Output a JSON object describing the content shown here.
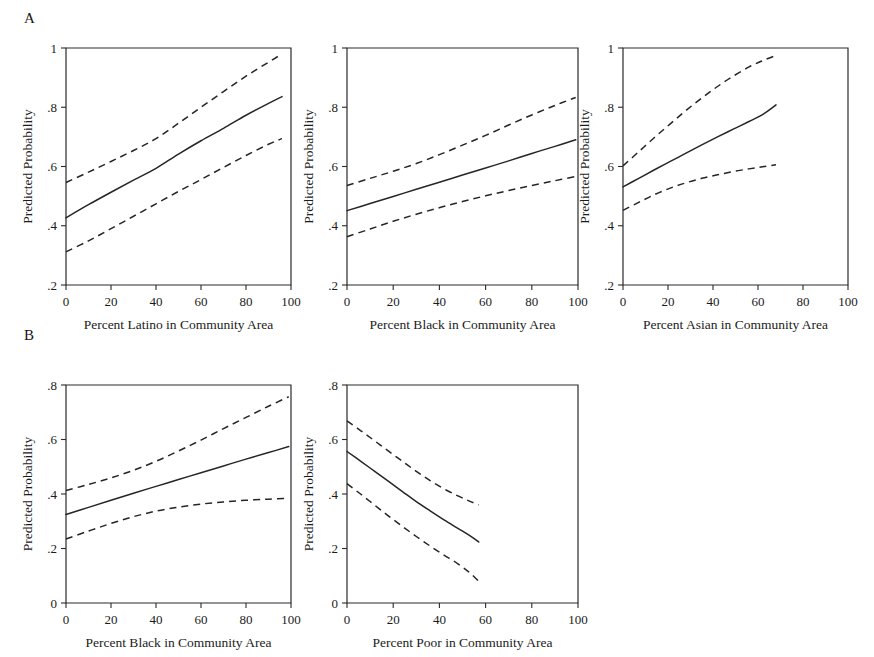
{
  "figure": {
    "background": "#ffffff",
    "line_color": "#252525",
    "panel_labels": [
      {
        "label": "A",
        "x": 24,
        "y": 10
      },
      {
        "label": "B",
        "x": 24,
        "y": 327
      }
    ]
  },
  "chart_data": [
    {
      "id": "a1",
      "panel_group": "A",
      "type": "line",
      "title": "",
      "xlabel": "Percent Latino in Community Area",
      "ylabel": "Predicted Probability",
      "xlim": [
        0,
        100
      ],
      "ylim": [
        0.2,
        1.0
      ],
      "xticks": [
        0,
        20,
        40,
        60,
        80,
        100
      ],
      "xticklabels": [
        "0",
        "20",
        "40",
        "60",
        "80",
        "100"
      ],
      "yticks": [
        0.2,
        0.4,
        0.6,
        0.8,
        1.0
      ],
      "yticklabels": [
        ".2",
        ".4",
        ".6",
        ".8",
        "1"
      ],
      "grid": false,
      "legend": "none",
      "x": [
        0,
        10,
        20,
        30,
        40,
        50,
        60,
        70,
        80,
        90,
        96
      ],
      "series": [
        {
          "name": "Predicted probability",
          "style": "solid",
          "values": [
            0.427,
            0.471,
            0.513,
            0.554,
            0.594,
            0.642,
            0.687,
            0.729,
            0.773,
            0.813,
            0.836
          ]
        },
        {
          "name": "Upper 95% CI",
          "style": "dashed",
          "values": [
            0.546,
            0.581,
            0.617,
            0.654,
            0.694,
            0.746,
            0.8,
            0.853,
            0.905,
            0.952,
            0.98
          ]
        },
        {
          "name": "Lower 95% CI",
          "style": "dashed",
          "values": [
            0.312,
            0.349,
            0.39,
            0.432,
            0.474,
            0.516,
            0.556,
            0.597,
            0.637,
            0.675,
            0.694
          ]
        }
      ]
    },
    {
      "id": "a2",
      "panel_group": "A",
      "type": "line",
      "title": "",
      "xlabel": "Percent Black in Community Area",
      "ylabel": "Predicted Probability",
      "xlim": [
        0,
        100
      ],
      "ylim": [
        0.2,
        1.0
      ],
      "xticks": [
        0,
        20,
        40,
        60,
        80,
        100
      ],
      "xticklabels": [
        "0",
        "20",
        "40",
        "60",
        "80",
        "100"
      ],
      "yticks": [
        0.2,
        0.4,
        0.6,
        0.8,
        1.0
      ],
      "yticklabels": [
        ".2",
        ".4",
        ".6",
        ".8",
        "1"
      ],
      "grid": false,
      "legend": "none",
      "x": [
        0,
        10,
        20,
        30,
        40,
        50,
        60,
        70,
        80,
        90,
        99
      ],
      "series": [
        {
          "name": "Predicted probability",
          "style": "solid",
          "values": [
            0.451,
            0.475,
            0.499,
            0.523,
            0.547,
            0.571,
            0.595,
            0.619,
            0.644,
            0.668,
            0.69
          ]
        },
        {
          "name": "Upper 95% CI",
          "style": "dashed",
          "values": [
            0.536,
            0.56,
            0.584,
            0.61,
            0.64,
            0.672,
            0.705,
            0.74,
            0.774,
            0.806,
            0.833
          ]
        },
        {
          "name": "Lower 95% CI",
          "style": "dashed",
          "values": [
            0.363,
            0.389,
            0.415,
            0.439,
            0.461,
            0.482,
            0.501,
            0.519,
            0.536,
            0.552,
            0.566
          ]
        }
      ]
    },
    {
      "id": "a3",
      "panel_group": "A",
      "type": "line",
      "title": "",
      "xlabel": "Percent Asian in Community Area",
      "ylabel": "Predicted Probability",
      "xlim": [
        0,
        100
      ],
      "ylim": [
        0.2,
        1.0
      ],
      "xticks": [
        0,
        20,
        40,
        60,
        80,
        100
      ],
      "xticklabels": [
        "0",
        "20",
        "40",
        "60",
        "80",
        "100"
      ],
      "yticks": [
        0.2,
        0.4,
        0.6,
        0.8,
        1.0
      ],
      "yticklabels": [
        ".2",
        ".4",
        ".6",
        ".8",
        "1"
      ],
      "grid": false,
      "legend": "none",
      "x": [
        0,
        7,
        14,
        21,
        28,
        35,
        42,
        49,
        56,
        62,
        68
      ],
      "series": [
        {
          "name": "Predicted probability",
          "style": "solid",
          "values": [
            0.531,
            0.56,
            0.589,
            0.617,
            0.645,
            0.673,
            0.7,
            0.726,
            0.752,
            0.775,
            0.808
          ]
        },
        {
          "name": "Upper 95% CI",
          "style": "dashed",
          "values": [
            0.602,
            0.65,
            0.698,
            0.744,
            0.789,
            0.831,
            0.87,
            0.905,
            0.936,
            0.957,
            0.975
          ]
        },
        {
          "name": "Lower 95% CI",
          "style": "dashed",
          "values": [
            0.452,
            0.479,
            0.505,
            0.527,
            0.545,
            0.56,
            0.572,
            0.583,
            0.592,
            0.599,
            0.606
          ]
        }
      ]
    },
    {
      "id": "b1",
      "panel_group": "B",
      "type": "line",
      "title": "",
      "xlabel": "Percent Black in Community Area",
      "ylabel": "Predicted Probability",
      "xlim": [
        0,
        100
      ],
      "ylim": [
        0.0,
        0.8
      ],
      "xticks": [
        0,
        20,
        40,
        60,
        80,
        100
      ],
      "xticklabels": [
        "0",
        "20",
        "40",
        "60",
        "80",
        "100"
      ],
      "yticks": [
        0.0,
        0.2,
        0.4,
        0.6,
        0.8
      ],
      "yticklabels": [
        "0",
        ".2",
        ".4",
        ".6",
        ".8"
      ],
      "grid": false,
      "legend": "none",
      "x": [
        0,
        10,
        20,
        30,
        40,
        50,
        60,
        70,
        80,
        90,
        99
      ],
      "series": [
        {
          "name": "Predicted probability",
          "style": "solid",
          "values": [
            0.325,
            0.351,
            0.377,
            0.403,
            0.428,
            0.453,
            0.478,
            0.503,
            0.528,
            0.552,
            0.574
          ]
        },
        {
          "name": "Upper 95% CI",
          "style": "dashed",
          "values": [
            0.413,
            0.435,
            0.459,
            0.487,
            0.52,
            0.558,
            0.598,
            0.64,
            0.681,
            0.722,
            0.757
          ]
        },
        {
          "name": "Lower 95% CI",
          "style": "dashed",
          "values": [
            0.235,
            0.264,
            0.292,
            0.317,
            0.337,
            0.352,
            0.363,
            0.371,
            0.377,
            0.381,
            0.384
          ]
        }
      ]
    },
    {
      "id": "b2",
      "panel_group": "B",
      "type": "line",
      "title": "",
      "xlabel": "Percent Poor in Community Area",
      "ylabel": "Predicted Probability",
      "xlim": [
        0,
        100
      ],
      "ylim": [
        0.0,
        0.8
      ],
      "xticks": [
        0,
        20,
        40,
        60,
        80,
        100
      ],
      "xticklabels": [
        "0",
        "20",
        "40",
        "60",
        "80",
        "100"
      ],
      "yticks": [
        0.0,
        0.2,
        0.4,
        0.6,
        0.8
      ],
      "yticklabels": [
        "0",
        ".2",
        ".4",
        ".6",
        ".8"
      ],
      "grid": false,
      "legend": "none",
      "x": [
        0,
        6,
        12,
        18,
        24,
        30,
        36,
        42,
        48,
        53,
        57
      ],
      "series": [
        {
          "name": "Predicted probability",
          "style": "solid",
          "values": [
            0.556,
            0.52,
            0.483,
            0.446,
            0.409,
            0.372,
            0.338,
            0.305,
            0.274,
            0.248,
            0.224
          ]
        },
        {
          "name": "Upper 95% CI",
          "style": "dashed",
          "values": [
            0.668,
            0.632,
            0.595,
            0.557,
            0.52,
            0.483,
            0.449,
            0.419,
            0.393,
            0.374,
            0.36
          ]
        },
        {
          "name": "Lower 95% CI",
          "style": "dashed",
          "values": [
            0.438,
            0.399,
            0.359,
            0.319,
            0.281,
            0.244,
            0.209,
            0.176,
            0.144,
            0.112,
            0.08
          ]
        }
      ]
    }
  ],
  "layout": {
    "panels": [
      {
        "id": "a1",
        "left": 66,
        "top": 48,
        "width": 225,
        "height": 237
      },
      {
        "id": "a2",
        "left": 347,
        "top": 48,
        "width": 231,
        "height": 237
      },
      {
        "id": "a3",
        "left": 623,
        "top": 48,
        "width": 225,
        "height": 237
      },
      {
        "id": "b1",
        "left": 66,
        "top": 385,
        "width": 225,
        "height": 218
      },
      {
        "id": "b2",
        "left": 347,
        "top": 385,
        "width": 231,
        "height": 218
      }
    ]
  }
}
